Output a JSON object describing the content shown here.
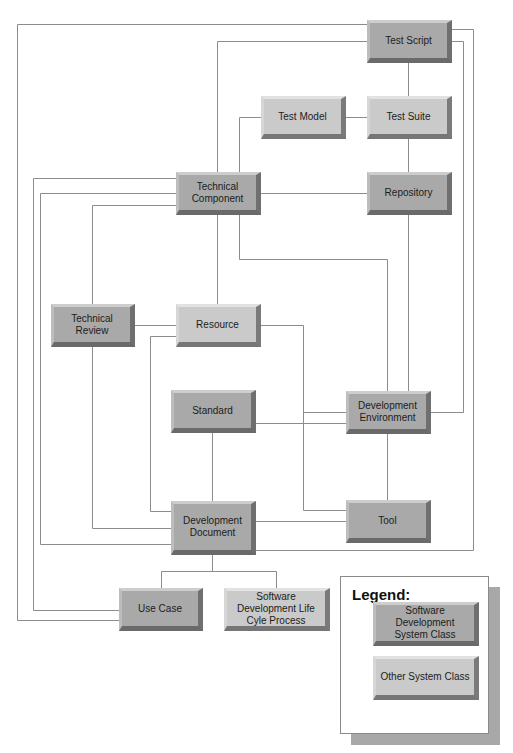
{
  "diagram": {
    "type": "class-relationship-diagram",
    "classes": {
      "standard_class_color": "#a9a9a9",
      "other_class_color": "#cacaca"
    },
    "nodes": [
      {
        "id": "test-script",
        "label": "Test Script",
        "class": "sds"
      },
      {
        "id": "test-model",
        "label": "Test Model",
        "class": "other"
      },
      {
        "id": "test-suite",
        "label": "Test Suite",
        "class": "other"
      },
      {
        "id": "technical-component",
        "label": "Technical Component",
        "class": "sds"
      },
      {
        "id": "repository",
        "label": "Repository",
        "class": "sds"
      },
      {
        "id": "technical-review",
        "label": "Technical Review",
        "class": "sds"
      },
      {
        "id": "resource",
        "label": "Resource",
        "class": "other"
      },
      {
        "id": "standard",
        "label": "Standard",
        "class": "sds"
      },
      {
        "id": "development-environment",
        "label": "Development Environment",
        "class": "sds"
      },
      {
        "id": "development-document",
        "label": "Development Document",
        "class": "sds"
      },
      {
        "id": "tool",
        "label": "Tool",
        "class": "sds"
      },
      {
        "id": "use-case",
        "label": "Use Case",
        "class": "sds"
      },
      {
        "id": "sdlc-process",
        "label": "Software Development Life Cyle Process",
        "class": "other"
      }
    ],
    "edges": [
      [
        "test-script",
        "test-suite"
      ],
      [
        "test-script",
        "technical-component"
      ],
      [
        "test-script",
        "use-case"
      ],
      [
        "test-script",
        "development-environment"
      ],
      [
        "test-script",
        "development-document"
      ],
      [
        "test-model",
        "test-suite"
      ],
      [
        "test-model",
        "technical-component"
      ],
      [
        "test-suite",
        "repository"
      ],
      [
        "technical-component",
        "repository"
      ],
      [
        "technical-component",
        "resource"
      ],
      [
        "technical-component",
        "technical-review"
      ],
      [
        "technical-component",
        "development-environment"
      ],
      [
        "technical-component",
        "use-case"
      ],
      [
        "technical-component",
        "development-document"
      ],
      [
        "repository",
        "development-environment"
      ],
      [
        "technical-review",
        "resource"
      ],
      [
        "technical-review",
        "development-document"
      ],
      [
        "resource",
        "development-document"
      ],
      [
        "resource",
        "tool"
      ],
      [
        "resource",
        "development-environment"
      ],
      [
        "standard",
        "development-environment"
      ],
      [
        "standard",
        "development-document"
      ],
      [
        "development-environment",
        "tool"
      ],
      [
        "development-document",
        "tool"
      ],
      [
        "development-document",
        "use-case"
      ],
      [
        "development-document",
        "sdlc-process"
      ]
    ]
  },
  "nodes_text": {
    "test_script": "Test Script",
    "test_model": "Test Model",
    "test_suite": "Test Suite",
    "technical_component": "Technical Component",
    "repository": "Repository",
    "technical_review": "Technical Review",
    "resource": "Resource",
    "standard": "Standard",
    "development_environment": "Development Environment",
    "development_document": "Development Document",
    "tool": "Tool",
    "use_case": "Use Case",
    "sdlc_process": "Software Development Life Cyle Process"
  },
  "legend": {
    "title": "Legend:",
    "items": [
      {
        "label": "Software Development System Class",
        "color": "#a9a9a9"
      },
      {
        "label": "Other System Class",
        "color": "#cacaca"
      }
    ]
  }
}
